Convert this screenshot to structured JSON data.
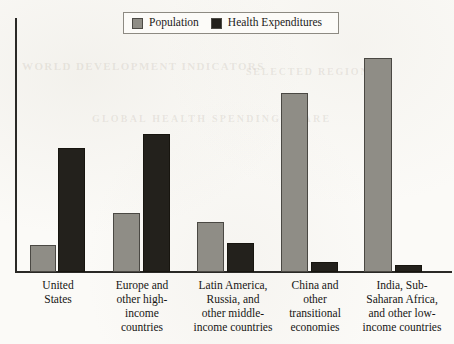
{
  "legend": {
    "entries": [
      {
        "label": "Population",
        "color": "#8f8d86",
        "series_key": "population"
      },
      {
        "label": "Health Expenditures",
        "color": "#23211c",
        "series_key": "health"
      }
    ]
  },
  "ghost_show_through": {
    "line_1": "WORLD DEVELOPMENT INDICATORS",
    "line_2": "GLOBAL HEALTH SPENDING SHARE",
    "line_3": "SELECTED REGIONS"
  },
  "axes": {
    "y_axis_visible": true,
    "x_axis_visible": true,
    "y_tick_labels": [],
    "x_tick_labels": [
      "United\nStates",
      "Europe and\nother high-\nincome\ncountries",
      "Latin America,\nRussia, and\nother middle-\nincome countries",
      "China and\nother\ntransitional\neconomies",
      "India, Sub-\nSaharan Africa,\nand other low-\nincome countries"
    ]
  },
  "chart_data": {
    "type": "bar",
    "title": "",
    "subtitle": "",
    "xlabel": "",
    "ylabel": "",
    "ylim": [
      0,
      100
    ],
    "grid": false,
    "legend_position": "top-center",
    "categories": [
      "United States",
      "Europe and other high-income countries",
      "Latin America, Russia, and other middle-income countries",
      "China and other transitional economies",
      "India, Sub-Saharan Africa, and other low-income countries"
    ],
    "series": [
      {
        "name": "Population",
        "color": "#8f8d86",
        "values": [
          5,
          11,
          20,
          36,
          43
        ]
      },
      {
        "name": "Health Expenditures",
        "color": "#23211c",
        "values": [
          26,
          29,
          6,
          2,
          1
        ]
      }
    ],
    "units": "percent of world total"
  },
  "bars": [
    {
      "group": 0,
      "series": "population",
      "label": "United States",
      "x": 30,
      "w": 26,
      "top": 245,
      "height": 27
    },
    {
      "group": 0,
      "series": "health",
      "label": "United States",
      "x": 58,
      "w": 27,
      "top": 148,
      "height": 124
    },
    {
      "group": 1,
      "series": "population",
      "label": "Europe and other high-income countries",
      "x": 113,
      "w": 27,
      "top": 213,
      "height": 59
    },
    {
      "group": 1,
      "series": "health",
      "label": "Europe and other high-income countries",
      "x": 143,
      "w": 27,
      "top": 134,
      "height": 138
    },
    {
      "group": 2,
      "series": "population",
      "label": "Latin America, Russia, and other middle-income countries",
      "x": 197,
      "w": 27,
      "top": 222,
      "height": 50
    },
    {
      "group": 2,
      "series": "health",
      "label": "Latin America, Russia, and other middle-income countries",
      "x": 227,
      "w": 27,
      "top": 243,
      "height": 29
    },
    {
      "group": 3,
      "series": "population",
      "label": "China and other transitional economies",
      "x": 281,
      "w": 27,
      "top": 93,
      "height": 179
    },
    {
      "group": 3,
      "series": "health",
      "label": "China and other transitional economies",
      "x": 311,
      "w": 27,
      "top": 262,
      "height": 10
    },
    {
      "group": 4,
      "series": "population",
      "label": "India, Sub-Saharan Africa, and other low-income countries",
      "x": 364,
      "w": 28,
      "top": 58,
      "height": 214
    },
    {
      "group": 4,
      "series": "health",
      "label": "India, Sub-Saharan Africa, and other low-income countries",
      "x": 395,
      "w": 27,
      "top": 265,
      "height": 7
    }
  ],
  "category_label_boxes": [
    {
      "left": 18,
      "width": 80,
      "text": "United\nStates"
    },
    {
      "left": 100,
      "width": 84,
      "text": "Europe and\nother high-\nincome\ncountries"
    },
    {
      "left": 185,
      "width": 96,
      "text": "Latin America,\nRussia, and\nother middle-\nincome countries"
    },
    {
      "left": 275,
      "width": 80,
      "text": "China and\nother\ntransitional\neconomies"
    },
    {
      "left": 354,
      "width": 96,
      "text": "India, Sub-\nSaharan Africa,\nand other low-\nincome countries"
    }
  ]
}
